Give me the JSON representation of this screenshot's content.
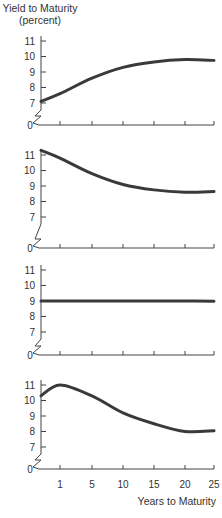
{
  "chart_data": [
    {
      "type": "line",
      "panel": "a",
      "title": "Upward-sloping yield curve",
      "ylabel": "Yield to Maturity (percent)",
      "xlabel": "",
      "y_ticks": [
        "0",
        "7",
        "8",
        "9",
        "10",
        "11"
      ],
      "x_ticks": [
        1,
        5,
        10,
        15,
        20,
        25
      ],
      "ylim": [
        7,
        11
      ],
      "y_axis_break": true,
      "x": [
        0,
        1,
        5,
        10,
        15,
        20,
        25
      ],
      "values": [
        7.1,
        7.6,
        8.6,
        9.3,
        9.65,
        9.8,
        9.75
      ]
    },
    {
      "type": "line",
      "panel": "b",
      "title": "Inverted (downward-sloping) yield curve",
      "y_ticks": [
        "0",
        "7",
        "8",
        "9",
        "10",
        "11"
      ],
      "x_ticks": [
        1,
        5,
        10,
        15,
        20,
        25
      ],
      "ylim": [
        7,
        11
      ],
      "y_axis_break": true,
      "x": [
        0,
        1,
        5,
        10,
        15,
        20,
        25
      ],
      "values": [
        11.3,
        10.8,
        9.8,
        9.1,
        8.75,
        8.6,
        8.65
      ]
    },
    {
      "type": "line",
      "panel": "c",
      "title": "Flat yield curve",
      "y_ticks": [
        "0",
        "7",
        "8",
        "9",
        "10",
        "11"
      ],
      "x_ticks": [
        1,
        5,
        10,
        15,
        20,
        25
      ],
      "ylim": [
        7,
        11
      ],
      "y_axis_break": true,
      "x": [
        0,
        1,
        5,
        10,
        15,
        20,
        25
      ],
      "values": [
        9.0,
        9.0,
        9.0,
        9.0,
        9.0,
        9.0,
        8.98
      ]
    },
    {
      "type": "line",
      "panel": "d",
      "title": "Humped yield curve",
      "xlabel": "Years to Maturity",
      "y_ticks": [
        "0",
        "7",
        "8",
        "9",
        "10",
        "11"
      ],
      "x_ticks": [
        1,
        5,
        10,
        15,
        20,
        25
      ],
      "ylim": [
        7,
        11
      ],
      "y_axis_break": true,
      "x": [
        0,
        1,
        5,
        10,
        15,
        20,
        25
      ],
      "values": [
        10.3,
        11.0,
        10.3,
        9.2,
        8.5,
        8.0,
        8.05
      ]
    }
  ],
  "labels": {
    "ylabel_line1": "Yield to Maturity",
    "ylabel_line2": "(percent)",
    "xlabel": "Years to Maturity",
    "x_tick_labels": [
      "1",
      "5",
      "10",
      "15",
      "20",
      "25"
    ],
    "y_tick_labels": [
      "11",
      "10",
      "9",
      "8",
      "7"
    ],
    "zero_label": "0"
  }
}
